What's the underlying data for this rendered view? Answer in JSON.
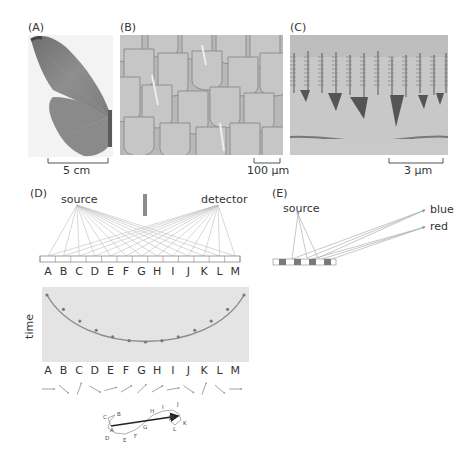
{
  "figure": {
    "panels": {
      "A": {
        "label": "(A)",
        "subject": "butterfly wing photograph",
        "scale_bar": "5 cm"
      },
      "B": {
        "label": "(B)",
        "subject": "wing scales micrograph",
        "scale_bar": "100 μm"
      },
      "C": {
        "label": "(C)",
        "subject": "scale ridge nanostructure micrograph",
        "scale_bar": "3 μm"
      },
      "D": {
        "label": "(D)",
        "source_label": "source",
        "detector_label": "detector",
        "mirror_letters": [
          "A",
          "B",
          "C",
          "D",
          "E",
          "F",
          "G",
          "H",
          "I",
          "J",
          "K",
          "L",
          "M"
        ],
        "time_plot": {
          "ylabel": "time",
          "letters": [
            "A",
            "B",
            "C",
            "D",
            "E",
            "F",
            "G",
            "H",
            "I",
            "J",
            "K",
            "L",
            "M"
          ]
        },
        "phasor_arrows_deg": [
          0,
          -40,
          70,
          -30,
          15,
          30,
          45,
          30,
          10,
          -35,
          70,
          -40,
          0
        ],
        "phasor_sum_labels": [
          "A",
          "B",
          "C",
          "D",
          "E",
          "F",
          "G",
          "H",
          "I",
          "J",
          "K",
          "L",
          "M"
        ]
      },
      "E": {
        "label": "(E)",
        "source_label": "source",
        "outputs": [
          "blue",
          "red"
        ]
      }
    },
    "colors": {
      "line": "#b5b5b5",
      "dark": "#555555",
      "plot_bg": "#e6e6e6",
      "curve": "#8a8a8a",
      "grating_dark": "#7a7a7a",
      "bar": "#8c8c8c"
    }
  }
}
